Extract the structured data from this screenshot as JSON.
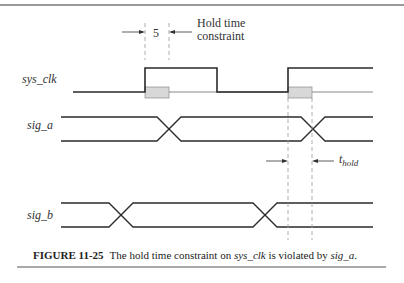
{
  "figure": {
    "number_label": "FIGURE 11-25",
    "caption_parts": {
      "pre": "The hold time constraint on ",
      "signal1": "sys_clk",
      "mid": " is violated by ",
      "signal2": "sig_a",
      "post": "."
    }
  },
  "annotations": {
    "hold_value": "5",
    "hold_note_line1": "Hold time",
    "hold_note_line2": "constraint",
    "t_hold_main": "t",
    "t_hold_sub": "hold"
  },
  "signals": [
    {
      "name": "sys_clk",
      "type": "clock"
    },
    {
      "name": "sig_a",
      "type": "bus"
    },
    {
      "name": "sig_b",
      "type": "bus"
    }
  ],
  "colors": {
    "line": "#2a2a2a",
    "dashed": "#9a9a9a",
    "hold_box_fill": "#d8d8d8",
    "hold_box_stroke": "#8a8a8a",
    "rule": "#777777"
  }
}
